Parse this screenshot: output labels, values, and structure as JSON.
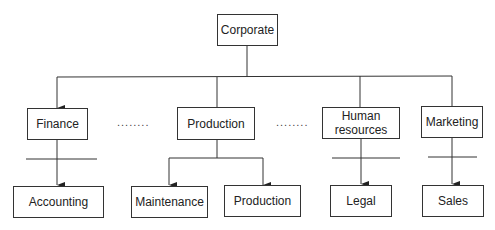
{
  "diagram": {
    "type": "organization-chart",
    "root": {
      "label": "Corporate"
    },
    "departments": [
      {
        "label": "Finance",
        "children": [
          "Accounting"
        ]
      },
      {
        "label": "Production",
        "children": [
          "Maintenance",
          "Production"
        ]
      },
      {
        "label": "Human resources",
        "label_lines": [
          "Human",
          "resources"
        ],
        "children": [
          "Legal"
        ]
      },
      {
        "label": "Marketing",
        "children": [
          "Sales"
        ]
      }
    ],
    "ellipsis": [
      "........",
      "........"
    ]
  }
}
